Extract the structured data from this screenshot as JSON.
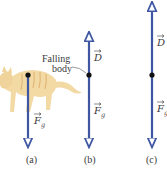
{
  "diagram": {
    "colors": {
      "vector": "#3f57a3",
      "dot": "#111111",
      "cat_body": "#f3d9a4",
      "cat_stripe": "#e0b97a",
      "text": "#3a3a3a"
    },
    "annotation": {
      "line1": "Falling",
      "line2": "body"
    },
    "panels": [
      {
        "id": "a",
        "caption": "(a)",
        "vectors": [
          {
            "symbol": "F",
            "subscript": "g",
            "direction": "down"
          }
        ],
        "has_cat": true
      },
      {
        "id": "b",
        "caption": "(b)",
        "vectors": [
          {
            "symbol": "D",
            "subscript": "",
            "direction": "up"
          },
          {
            "symbol": "F",
            "subscript": "g",
            "direction": "down"
          }
        ]
      },
      {
        "id": "c",
        "caption": "(c)",
        "vectors": [
          {
            "symbol": "D",
            "subscript": "",
            "direction": "up"
          },
          {
            "symbol": "F",
            "subscript": "g",
            "direction": "down"
          }
        ]
      }
    ]
  }
}
